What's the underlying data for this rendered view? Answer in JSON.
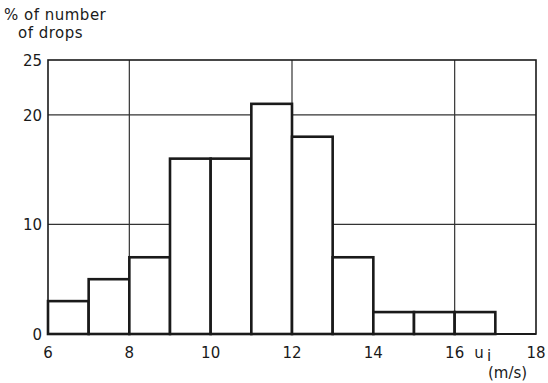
{
  "chart_data": {
    "type": "bar",
    "subtype": "histogram",
    "title": "",
    "ylabel": "% of number of drops",
    "ylabel_lines": [
      "% of number",
      "of drops"
    ],
    "xlabel": "u_i (m/s)",
    "xlabel_symbol": "u",
    "xlabel_subscript": "i",
    "xlabel_units": "(m/s)",
    "xlim": [
      6,
      18
    ],
    "ylim": [
      0,
      25
    ],
    "x_ticks": [
      6,
      8,
      10,
      12,
      14,
      16,
      18
    ],
    "y_ticks": [
      0,
      10,
      20,
      25
    ],
    "grid": {
      "horizontal": [
        10,
        20
      ],
      "vertical": [
        8,
        12,
        16
      ]
    },
    "bins": [
      {
        "from": 6,
        "to": 7,
        "value": 3
      },
      {
        "from": 7,
        "to": 8,
        "value": 5
      },
      {
        "from": 8,
        "to": 9,
        "value": 7
      },
      {
        "from": 9,
        "to": 10,
        "value": 16
      },
      {
        "from": 10,
        "to": 11,
        "value": 16
      },
      {
        "from": 11,
        "to": 12,
        "value": 21
      },
      {
        "from": 12,
        "to": 13,
        "value": 18
      },
      {
        "from": 13,
        "to": 14,
        "value": 7
      },
      {
        "from": 14,
        "to": 15,
        "value": 2
      },
      {
        "from": 15,
        "to": 16,
        "value": 2
      },
      {
        "from": 16,
        "to": 17,
        "value": 2
      }
    ],
    "categories": [
      "6-7",
      "7-8",
      "8-9",
      "9-10",
      "10-11",
      "11-12",
      "12-13",
      "13-14",
      "14-15",
      "15-16",
      "16-17"
    ],
    "values": [
      3,
      5,
      7,
      16,
      16,
      21,
      18,
      7,
      2,
      2,
      2
    ],
    "legend": null
  },
  "colors": {
    "line": "#1a1a1a",
    "grid": "#333333",
    "background": "#ffffff"
  }
}
